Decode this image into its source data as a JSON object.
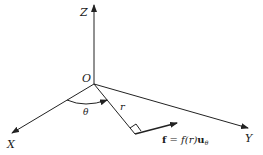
{
  "diagram": {
    "type": "3d-coordinate-system",
    "axes": {
      "z_label": "Z",
      "x_label": "X",
      "y_label": "Y"
    },
    "origin_label": "O",
    "angle_label": "θ",
    "radius_label": "r",
    "force": {
      "symbol": "f",
      "equals": " = ",
      "func": "f",
      "arg": "(r)",
      "unit_vector": "u",
      "unit_subscript": "θ"
    },
    "colors": {
      "line": "#222222",
      "background": "#ffffff"
    }
  }
}
